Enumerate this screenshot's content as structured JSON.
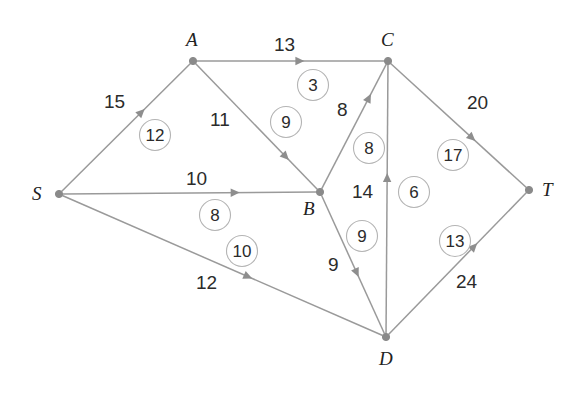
{
  "diagram": {
    "type": "flow-network",
    "source": "S",
    "sink": "T",
    "colors": {
      "edge": "#9a9a9a",
      "node": "#8a8a8a",
      "ring_stroke": "#b4b4b4",
      "text": "#2b2b2b",
      "background": "#ffffff"
    },
    "nodes": [
      {
        "id": "S",
        "label": "S",
        "x": 59,
        "y": 194,
        "label_x": 32,
        "label_y": 184
      },
      {
        "id": "A",
        "label": "A",
        "x": 193,
        "y": 61,
        "label_x": 186,
        "label_y": 30
      },
      {
        "id": "C",
        "label": "C",
        "x": 388,
        "y": 61,
        "label_x": 381,
        "label_y": 30
      },
      {
        "id": "B",
        "label": "B",
        "x": 320,
        "y": 192,
        "label_x": 303,
        "label_y": 199
      },
      {
        "id": "D",
        "label": "D",
        "x": 386,
        "y": 337,
        "label_x": 379,
        "label_y": 349
      },
      {
        "id": "T",
        "label": "T",
        "x": 529,
        "y": 190,
        "label_x": 542,
        "label_y": 180
      }
    ],
    "edges": [
      {
        "id": "S-A",
        "from": "S",
        "to": "A",
        "capacity": "15",
        "flow": "12",
        "cap_x": 104,
        "cap_y": 92,
        "flow_cx": 155,
        "flow_cy": 135,
        "arrow_t": 0.62
      },
      {
        "id": "S-B",
        "from": "S",
        "to": "B",
        "capacity": "10",
        "flow": "8",
        "cap_x": 186,
        "cap_y": 169,
        "flow_cx": 215,
        "flow_cy": 215,
        "arrow_t": 0.68
      },
      {
        "id": "S-D",
        "from": "S",
        "to": "D",
        "capacity": "12",
        "flow": "10",
        "cap_x": 196,
        "cap_y": 273,
        "flow_cx": 242,
        "flow_cy": 251,
        "arrow_t": 0.58
      },
      {
        "id": "A-C",
        "from": "A",
        "to": "C",
        "capacity": "13",
        "flow": "3",
        "cap_x": 274,
        "cap_y": 35,
        "flow_cx": 313,
        "flow_cy": 85,
        "arrow_t": 0.55
      },
      {
        "id": "A-B",
        "from": "A",
        "to": "B",
        "capacity": "11",
        "flow": "9",
        "cap_x": 210,
        "cap_y": 110,
        "flow_cx": 286,
        "flow_cy": 122,
        "arrow_t": 0.74
      },
      {
        "id": "B-C",
        "from": "B",
        "to": "C",
        "capacity": "8",
        "flow": "8",
        "cap_x": 337,
        "cap_y": 100,
        "flow_cx": 369,
        "flow_cy": 148,
        "arrow_t": 0.73
      },
      {
        "id": "B-D",
        "from": "B",
        "to": "D",
        "capacity": "9",
        "flow": "9",
        "cap_x": 328,
        "cap_y": 255,
        "flow_cx": 362,
        "flow_cy": 236,
        "arrow_t": 0.56
      },
      {
        "id": "D-C",
        "from": "D",
        "to": "C",
        "capacity": "14",
        "flow": "6",
        "cap_x": 352,
        "cap_y": 182,
        "flow_cx": 414,
        "flow_cy": 192,
        "arrow_t": 0.58
      },
      {
        "id": "C-T",
        "from": "C",
        "to": "T",
        "capacity": "20",
        "flow": "17",
        "cap_x": 467,
        "cap_y": 93,
        "flow_cx": 453,
        "flow_cy": 155,
        "arrow_t": 0.6
      },
      {
        "id": "D-T",
        "from": "D",
        "to": "T",
        "capacity": "24",
        "flow": "13",
        "cap_x": 456,
        "cap_y": 272,
        "flow_cx": 455,
        "flow_cy": 241,
        "arrow_t": 0.62
      }
    ]
  },
  "chart_data": {
    "type": "diagram",
    "nodes": [
      "S",
      "A",
      "B",
      "C",
      "D",
      "T"
    ],
    "edges": [
      {
        "from": "S",
        "to": "A",
        "capacity": 15,
        "flow": 12
      },
      {
        "from": "S",
        "to": "B",
        "capacity": 10,
        "flow": 8
      },
      {
        "from": "S",
        "to": "D",
        "capacity": 12,
        "flow": 10
      },
      {
        "from": "A",
        "to": "C",
        "capacity": 13,
        "flow": 3
      },
      {
        "from": "A",
        "to": "B",
        "capacity": 11,
        "flow": 9
      },
      {
        "from": "B",
        "to": "C",
        "capacity": 8,
        "flow": 8
      },
      {
        "from": "B",
        "to": "D",
        "capacity": 9,
        "flow": 9
      },
      {
        "from": "D",
        "to": "C",
        "capacity": 14,
        "flow": 6
      },
      {
        "from": "C",
        "to": "T",
        "capacity": 20,
        "flow": 17
      },
      {
        "from": "D",
        "to": "T",
        "capacity": 24,
        "flow": 13
      }
    ],
    "legend": "Plain numbers are edge capacities; circled numbers are flows along the edge",
    "source": "S",
    "sink": "T"
  }
}
